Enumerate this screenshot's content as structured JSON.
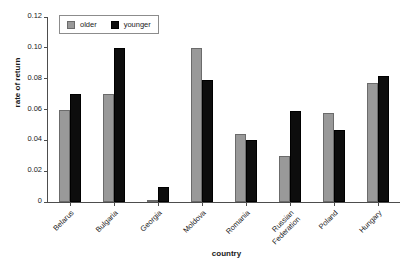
{
  "chart_data": {
    "type": "bar",
    "title": "",
    "xlabel": "country",
    "ylabel": "rate of return",
    "categories": [
      "Belarus",
      "Bulgaria",
      "Georgia",
      "Moldova",
      "Romania",
      "Russian Federation",
      "Poland",
      "Hungary"
    ],
    "series": [
      {
        "name": "older",
        "color": "#999999",
        "values": [
          0.06,
          0.07,
          0.001,
          0.1,
          0.044,
          0.03,
          0.058,
          0.077
        ]
      },
      {
        "name": "younger",
        "color": "#0d0d0d",
        "values": [
          0.07,
          0.1,
          0.01,
          0.079,
          0.04,
          0.059,
          0.047,
          0.082
        ]
      }
    ],
    "ylim": [
      0,
      0.12
    ],
    "ytick_values": [
      0,
      0.02,
      0.04,
      0.06,
      0.08,
      0.1,
      0.12
    ],
    "ytick_labels": [
      "0",
      "0.02",
      "0.04",
      "0.06",
      "0.08",
      "0.10",
      "0.12"
    ],
    "grid": false,
    "legend_position": "top-left",
    "legend_entries": [
      "older",
      "younger"
    ]
  }
}
